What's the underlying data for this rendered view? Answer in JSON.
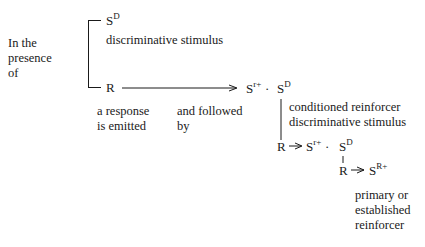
{
  "diagram": {
    "context_label": [
      "In the",
      "presence",
      "of"
    ],
    "sd_top": {
      "base": "S",
      "sup": "D"
    },
    "sd_top_label": "discriminative stimulus",
    "r1": "R",
    "r1_label": [
      "a response",
      "is emitted"
    ],
    "arrow1_label": [
      "and followed",
      "by"
    ],
    "step1": {
      "sr_base": "S",
      "sr_sup": "r+",
      "dot": "·",
      "sd_base": "S",
      "sd_sup": "D"
    },
    "step1_label": [
      "conditioned reinforcer",
      "discriminative stimulus"
    ],
    "r2": "R",
    "step2": {
      "sr_base": "S",
      "sr_sup": "r+",
      "dot": "·",
      "sd_base": "S",
      "sd_sup": "D"
    },
    "r3": "R",
    "final": {
      "base": "S",
      "sup": "R+"
    },
    "final_label": [
      "primary or",
      "established",
      "reinforcer"
    ]
  }
}
